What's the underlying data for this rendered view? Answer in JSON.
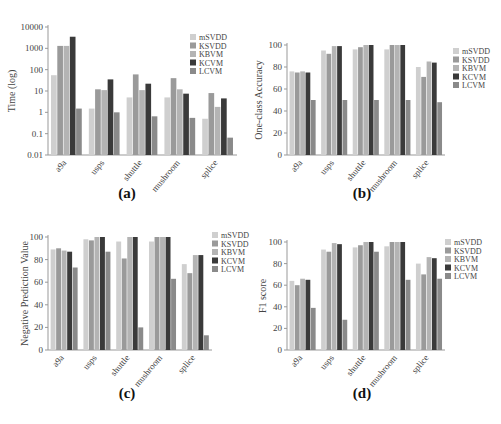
{
  "figure": {
    "series_names": [
      "mSVDD",
      "KSVDD",
      "KBVM",
      "KCVM",
      "LCVM"
    ],
    "series_colors": [
      "#cfcfcf",
      "#9a9a9a",
      "#b4b4b4",
      "#3a3a3a",
      "#8a8a8a"
    ],
    "categories": [
      "a9a",
      "usps",
      "shuttle",
      "mushroom",
      "splice"
    ]
  },
  "chart_data": [
    {
      "panel": "(a)",
      "type": "bar",
      "yscale": "log",
      "title": "",
      "xlabel": "",
      "ylabel": "Time (log)",
      "ylim": [
        0.01,
        10000
      ],
      "yticks": [
        "0.01",
        "0.1",
        "1",
        "10",
        "100",
        "1000",
        "10000"
      ],
      "categories": [
        "a9a",
        "usps",
        "shuttle",
        "mushroom",
        "splice"
      ],
      "legend_position": "upper right",
      "grid": false,
      "series": [
        {
          "name": "mSVDD",
          "values": [
            55,
            1.5,
            5,
            5,
            0.5
          ]
        },
        {
          "name": "KSVDD",
          "values": [
            1300,
            12,
            60,
            40,
            8
          ]
        },
        {
          "name": "KBVM",
          "values": [
            1300,
            11,
            11,
            12,
            1.8
          ]
        },
        {
          "name": "KCVM",
          "values": [
            3500,
            35,
            22,
            7.5,
            4.5
          ]
        },
        {
          "name": "LCVM",
          "values": [
            1.5,
            1.0,
            0.65,
            0.55,
            0.065
          ]
        }
      ]
    },
    {
      "panel": "(b)",
      "type": "bar",
      "title": "",
      "xlabel": "",
      "ylabel": "One-class Accuracy",
      "ylim": [
        0,
        100
      ],
      "yticks": [
        "0",
        "20",
        "40",
        "60",
        "80",
        "100"
      ],
      "categories": [
        "a9a",
        "usps",
        "shuttle",
        "mushroom",
        "splice"
      ],
      "legend_position": "upper right",
      "grid": false,
      "series": [
        {
          "name": "mSVDD",
          "values": [
            76,
            95,
            96,
            96,
            80
          ]
        },
        {
          "name": "KSVDD",
          "values": [
            75,
            92,
            98,
            100,
            71
          ]
        },
        {
          "name": "KBVM",
          "values": [
            76,
            99,
            100,
            100,
            85
          ]
        },
        {
          "name": "KCVM",
          "values": [
            75,
            99,
            100,
            100,
            84
          ]
        },
        {
          "name": "LCVM",
          "values": [
            50,
            50,
            50,
            50,
            48
          ]
        }
      ]
    },
    {
      "panel": "(c)",
      "type": "bar",
      "title": "",
      "xlabel": "",
      "ylabel": "Negative Prediction Value",
      "ylim": [
        0,
        100
      ],
      "yticks": [
        "0",
        "20",
        "40",
        "60",
        "80",
        "100"
      ],
      "categories": [
        "a9a",
        "usps",
        "shuttle",
        "mushroom",
        "splice"
      ],
      "legend_position": "upper right",
      "grid": false,
      "series": [
        {
          "name": "mSVDD",
          "values": [
            89,
            98,
            96,
            96,
            76
          ]
        },
        {
          "name": "KSVDD",
          "values": [
            90,
            97,
            81,
            100,
            68
          ]
        },
        {
          "name": "KBVM",
          "values": [
            88,
            100,
            100,
            100,
            84
          ]
        },
        {
          "name": "KCVM",
          "values": [
            87,
            100,
            100,
            100,
            84
          ]
        },
        {
          "name": "LCVM",
          "values": [
            73,
            87,
            20,
            63,
            13
          ]
        }
      ]
    },
    {
      "panel": "(d)",
      "type": "bar",
      "title": "",
      "xlabel": "",
      "ylabel": "F1 score",
      "ylim": [
        0,
        100
      ],
      "yticks": [
        "0",
        "20",
        "40",
        "60",
        "80",
        "100"
      ],
      "categories": [
        "a9a",
        "usps",
        "shuttle",
        "mushroom",
        "splice"
      ],
      "legend_position": "upper right",
      "grid": false,
      "series": [
        {
          "name": "mSVDD",
          "values": [
            64,
            93,
            95,
            96,
            80
          ]
        },
        {
          "name": "KSVDD",
          "values": [
            60,
            91,
            97,
            100,
            70
          ]
        },
        {
          "name": "KBVM",
          "values": [
            66,
            99,
            100,
            100,
            86
          ]
        },
        {
          "name": "KCVM",
          "values": [
            65,
            98,
            100,
            100,
            85
          ]
        },
        {
          "name": "LCVM",
          "values": [
            39,
            28,
            91,
            65,
            66
          ]
        }
      ]
    }
  ],
  "captions": [
    "(a)",
    "(b)",
    "(c)",
    "(d)"
  ]
}
